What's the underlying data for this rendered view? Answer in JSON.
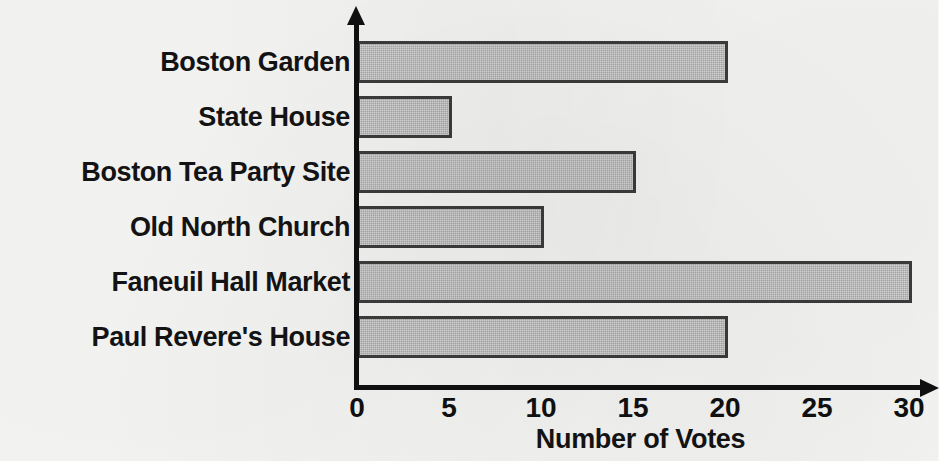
{
  "chart_data": {
    "type": "bar",
    "orientation": "horizontal",
    "title": "",
    "subtitle": "",
    "xlabel": "Number of Votes",
    "ylabel": "",
    "categories": [
      "Boston Garden",
      "State House",
      "Boston Tea Party Site",
      "Old North Church",
      "Faneuil Hall Market",
      "Paul Revere's House"
    ],
    "values": [
      20,
      5,
      15,
      10,
      30,
      20
    ],
    "xlim": [
      0,
      30
    ],
    "xticks": [
      "0",
      "5",
      "10",
      "15",
      "20",
      "25",
      "30"
    ],
    "xtick_values": [
      0,
      5,
      10,
      15,
      20,
      25,
      30
    ],
    "grid": false,
    "legend": null,
    "annotations": []
  },
  "style": {
    "bar_fill": "#a9a9a9",
    "bar_border": "#3c3c3c",
    "axis_color": "#101010",
    "text_color": "#131313",
    "background": "#f7f7f6"
  }
}
